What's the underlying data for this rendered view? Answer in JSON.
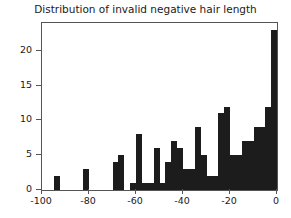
{
  "chart_data": {
    "type": "bar",
    "title": "Distribution of invalid negative hair length",
    "xlabel": "",
    "ylabel": "",
    "xlim": [
      -100,
      0
    ],
    "ylim": [
      0,
      24
    ],
    "grid": false,
    "legend": null,
    "bar_color": "#1c1c1c",
    "bin_width": 2.5,
    "xticks": [
      -100,
      -80,
      -60,
      -40,
      -20,
      0
    ],
    "xtick_labels": [
      "-100",
      "-80",
      "-60",
      "-40",
      "-20",
      "0"
    ],
    "yticks": [
      0,
      5,
      10,
      15,
      20
    ],
    "ytick_labels": [
      "0",
      "5",
      "10",
      "15",
      "20"
    ],
    "bins": [
      {
        "x0": -100.0,
        "x1": -97.5,
        "value": 0
      },
      {
        "x0": -97.5,
        "x1": -95.0,
        "value": 0
      },
      {
        "x0": -95.0,
        "x1": -92.5,
        "value": 2
      },
      {
        "x0": -92.5,
        "x1": -90.0,
        "value": 0
      },
      {
        "x0": -90.0,
        "x1": -87.5,
        "value": 0
      },
      {
        "x0": -87.5,
        "x1": -85.0,
        "value": 0
      },
      {
        "x0": -85.0,
        "x1": -82.5,
        "value": 0
      },
      {
        "x0": -82.5,
        "x1": -80.0,
        "value": 3
      },
      {
        "x0": -80.0,
        "x1": -77.5,
        "value": 0
      },
      {
        "x0": -77.5,
        "x1": -75.0,
        "value": 0
      },
      {
        "x0": -75.0,
        "x1": -72.5,
        "value": 0
      },
      {
        "x0": -72.5,
        "x1": -70.0,
        "value": 0
      },
      {
        "x0": -70.0,
        "x1": -67.5,
        "value": 4
      },
      {
        "x0": -67.5,
        "x1": -65.0,
        "value": 5
      },
      {
        "x0": -65.0,
        "x1": -62.5,
        "value": 0
      },
      {
        "x0": -62.5,
        "x1": -60.0,
        "value": 1
      },
      {
        "x0": -60.0,
        "x1": -57.5,
        "value": 8
      },
      {
        "x0": -57.5,
        "x1": -55.0,
        "value": 1
      },
      {
        "x0": -55.0,
        "x1": -52.5,
        "value": 1
      },
      {
        "x0": -52.5,
        "x1": -50.0,
        "value": 6
      },
      {
        "x0": -50.0,
        "x1": -47.5,
        "value": 1
      },
      {
        "x0": -47.5,
        "x1": -45.0,
        "value": 4
      },
      {
        "x0": -45.0,
        "x1": -42.5,
        "value": 7
      },
      {
        "x0": -42.5,
        "x1": -40.0,
        "value": 6
      },
      {
        "x0": -40.0,
        "x1": -37.5,
        "value": 3
      },
      {
        "x0": -37.5,
        "x1": -35.0,
        "value": 3
      },
      {
        "x0": -35.0,
        "x1": -32.5,
        "value": 9
      },
      {
        "x0": -32.5,
        "x1": -30.0,
        "value": 5
      },
      {
        "x0": -30.0,
        "x1": -27.5,
        "value": 2
      },
      {
        "x0": -27.5,
        "x1": -25.0,
        "value": 2
      },
      {
        "x0": -25.0,
        "x1": -22.5,
        "value": 11
      },
      {
        "x0": -22.5,
        "x1": -20.0,
        "value": 12
      },
      {
        "x0": -20.0,
        "x1": -17.5,
        "value": 5
      },
      {
        "x0": -17.5,
        "x1": -15.0,
        "value": 5
      },
      {
        "x0": -15.0,
        "x1": -12.5,
        "value": 7
      },
      {
        "x0": -12.5,
        "x1": -10.0,
        "value": 7
      },
      {
        "x0": -10.0,
        "x1": -7.5,
        "value": 9
      },
      {
        "x0": -7.5,
        "x1": -5.0,
        "value": 9
      },
      {
        "x0": -5.0,
        "x1": -2.5,
        "value": 12
      },
      {
        "x0": -2.5,
        "x1": 0.0,
        "value": 23
      }
    ]
  }
}
